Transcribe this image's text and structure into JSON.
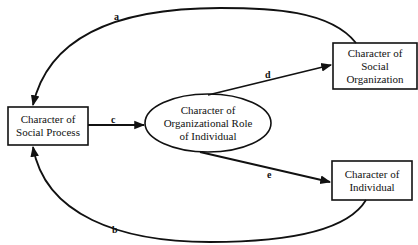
{
  "diagram": {
    "nodes": {
      "social_process": {
        "lines": [
          "Character of",
          "Social Process"
        ],
        "shape": "rectangle"
      },
      "organizational_role": {
        "lines": [
          "Character of",
          "Organizational Role",
          "of Individual"
        ],
        "shape": "ellipse"
      },
      "social_organization": {
        "lines": [
          "Character of",
          "Social",
          "Organization"
        ],
        "shape": "rectangle"
      },
      "individual": {
        "lines": [
          "Character of",
          "Individual"
        ],
        "shape": "rectangle"
      }
    },
    "edges": [
      {
        "label": "a",
        "from": "Character of Social Organization",
        "to": "Character of Social Process"
      },
      {
        "label": "b",
        "from": "Character of Individual",
        "to": "Character of Social Process"
      },
      {
        "label": "c",
        "from": "Character of Social Process",
        "to": "Character of Organizational Role of Individual"
      },
      {
        "label": "d",
        "from": "Character of Organizational Role of Individual",
        "to": "Character of Social Organization"
      },
      {
        "label": "e",
        "from": "Character of Organizational Role of Individual",
        "to": "Character of Individual"
      }
    ],
    "colors": {
      "stroke": "#111111",
      "background": "#ffffff"
    }
  }
}
